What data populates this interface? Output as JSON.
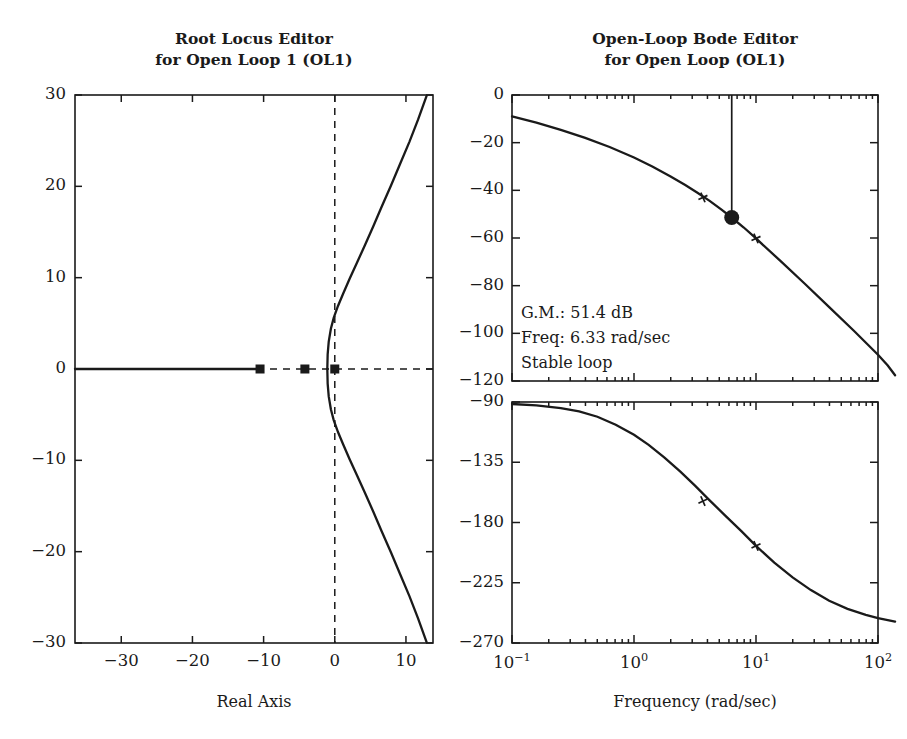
{
  "figure": {
    "background": "#ffffff",
    "ink": "#1a1a1a",
    "width": 907,
    "height": 739
  },
  "root_locus": {
    "title_line1": "Root Locus Editor",
    "title_line2": "for Open Loop 1 (OL1)",
    "xlabel": "Real Axis",
    "ylabel": "",
    "frame": {
      "x": 75,
      "y": 95,
      "w": 358,
      "h": 548
    },
    "xlim": [
      -36.5,
      13.8
    ],
    "ylim": [
      -30,
      30
    ],
    "xticks": [
      -30,
      -20,
      -10,
      0,
      10
    ],
    "xticklabels": [
      "−30",
      "−20",
      "−10",
      "0",
      "10"
    ],
    "yticks": [
      30,
      20,
      10,
      0,
      -10,
      -20,
      -30
    ],
    "yticklabels": [
      "30",
      "20",
      "10",
      "0",
      "−10",
      "−20",
      "−30"
    ],
    "grid": false,
    "axis_lines": {
      "real_axis": 0,
      "imag_axis": 0,
      "style": "dashed"
    },
    "poles": [
      {
        "re": -10.5,
        "im": 0,
        "marker": "square"
      },
      {
        "re": -4.2,
        "im": 0,
        "marker": "square"
      },
      {
        "re": 0.0,
        "im": 0,
        "marker": "square"
      }
    ],
    "zeros": [],
    "branches": [
      {
        "name": "real-axis-left",
        "points": [
          [
            -36.5,
            0
          ],
          [
            -10.5,
            0
          ]
        ]
      },
      {
        "name": "upper-branch",
        "points": [
          [
            -1.05,
            0
          ],
          [
            -1.0,
            1.6
          ],
          [
            -0.85,
            3.0
          ],
          [
            -0.55,
            4.4
          ],
          [
            -0.15,
            5.6
          ],
          [
            0.45,
            6.9
          ],
          [
            1.2,
            8.3
          ],
          [
            2.1,
            9.9
          ],
          [
            3.1,
            11.6
          ],
          [
            4.2,
            13.5
          ],
          [
            5.4,
            15.6
          ],
          [
            6.6,
            17.8
          ],
          [
            7.9,
            20.1
          ],
          [
            9.2,
            22.5
          ],
          [
            10.5,
            24.9
          ],
          [
            11.7,
            27.3
          ],
          [
            12.9,
            29.9
          ]
        ]
      },
      {
        "name": "lower-branch",
        "points": [
          [
            -1.05,
            0
          ],
          [
            -1.0,
            -1.6
          ],
          [
            -0.85,
            -3.0
          ],
          [
            -0.55,
            -4.4
          ],
          [
            -0.15,
            -5.6
          ],
          [
            0.45,
            -6.9
          ],
          [
            1.2,
            -8.3
          ],
          [
            2.1,
            -9.9
          ],
          [
            3.1,
            -11.6
          ],
          [
            4.2,
            -13.5
          ],
          [
            5.4,
            -15.6
          ],
          [
            6.6,
            -17.8
          ],
          [
            7.9,
            -20.1
          ],
          [
            9.2,
            -22.5
          ],
          [
            10.5,
            -24.9
          ],
          [
            11.7,
            -27.3
          ],
          [
            12.9,
            -29.9
          ]
        ]
      }
    ]
  },
  "bode": {
    "title_line1": "Open-Loop Bode Editor",
    "title_line2": "for Open Loop (OL1)",
    "xlabel": "Frequency (rad/sec)",
    "xlim_decades": [
      -1,
      2
    ],
    "xticks": [
      "10",
      "10",
      "10",
      "10"
    ],
    "xtick_exponents": [
      "−1",
      "0",
      "1",
      "2"
    ],
    "magnitude": {
      "frame": {
        "x": 512,
        "y": 95,
        "w": 366,
        "h": 286
      },
      "ylim": [
        -120,
        0
      ],
      "yticks": [
        0,
        -20,
        -40,
        -60,
        -80,
        -100,
        -120
      ],
      "yticklabels": [
        "0",
        "−20",
        "−40",
        "−60",
        "−80",
        "−100",
        "−120"
      ],
      "ylabel": "",
      "curve": [
        [
          -1.0,
          -9.0
        ],
        [
          -0.8,
          -11.6
        ],
        [
          -0.6,
          -14.6
        ],
        [
          -0.4,
          -18.0
        ],
        [
          -0.2,
          -21.8
        ],
        [
          0.0,
          -26.2
        ],
        [
          0.15,
          -30.0
        ],
        [
          0.3,
          -34.2
        ],
        [
          0.42,
          -37.8
        ],
        [
          0.52,
          -41.0
        ],
        [
          0.62,
          -44.4
        ],
        [
          0.72,
          -48.2
        ],
        [
          0.8,
          -51.4
        ],
        [
          0.9,
          -55.6
        ],
        [
          1.0,
          -60.2
        ],
        [
          1.2,
          -69.6
        ],
        [
          1.4,
          -79.2
        ],
        [
          1.6,
          -89.0
        ],
        [
          1.8,
          -98.8
        ],
        [
          2.0,
          -109.0
        ],
        [
          2.08,
          -113.5
        ],
        [
          2.14,
          -117.6
        ]
      ],
      "gain_marker": {
        "freq_log": 0.801,
        "mag_db": -51.4,
        "style": "filled-dot"
      },
      "drop_line": {
        "freq_log": 0.801,
        "from_db": 0,
        "to_db": -51.4
      },
      "cross_markers": [
        {
          "freq_log": 0.565,
          "mag_db": -43.0
        },
        {
          "freq_log": 1.0,
          "mag_db": -60.2
        }
      ]
    },
    "phase": {
      "frame": {
        "x": 512,
        "y": 402,
        "w": 366,
        "h": 241
      },
      "ylim": [
        -270,
        -90
      ],
      "yticks": [
        -90,
        -135,
        -180,
        -225,
        -270
      ],
      "yticklabels": [
        "−90",
        "−135",
        "−180",
        "−225",
        "−270"
      ],
      "ylabel": "",
      "curve": [
        [
          -1.0,
          -91.5
        ],
        [
          -0.8,
          -92.5
        ],
        [
          -0.6,
          -94.5
        ],
        [
          -0.45,
          -97.0
        ],
        [
          -0.3,
          -101.0
        ],
        [
          -0.15,
          -107.0
        ],
        [
          0.0,
          -114.5
        ],
        [
          0.12,
          -122.0
        ],
        [
          0.25,
          -131.5
        ],
        [
          0.38,
          -142.0
        ],
        [
          0.5,
          -152.5
        ],
        [
          0.62,
          -163.5
        ],
        [
          0.75,
          -175.0
        ],
        [
          0.88,
          -186.5
        ],
        [
          1.0,
          -197.5
        ],
        [
          1.15,
          -210.0
        ],
        [
          1.3,
          -221.0
        ],
        [
          1.45,
          -230.5
        ],
        [
          1.6,
          -238.5
        ],
        [
          1.75,
          -244.5
        ],
        [
          1.9,
          -249.0
        ],
        [
          2.0,
          -251.5
        ],
        [
          2.14,
          -254.0
        ]
      ],
      "cross_markers": [
        {
          "freq_log": 0.565,
          "phase_deg": -164.0
        },
        {
          "freq_log": 1.0,
          "phase_deg": -197.5
        }
      ]
    },
    "annotation": {
      "gain_margin": "G.M.: 51.4 dB",
      "frequency": "Freq: 6.33 rad/sec",
      "stability": "Stable loop"
    }
  }
}
